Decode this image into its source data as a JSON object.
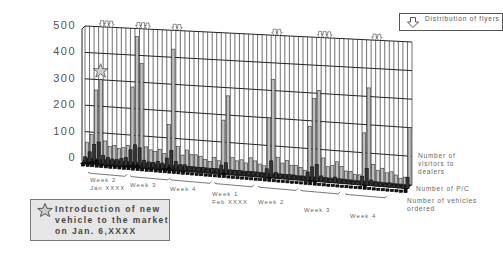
{
  "chart_data": {
    "type": "bar",
    "title": "",
    "xlabel": "",
    "ylabel": "",
    "ylim": [
      0,
      500
    ],
    "y_ticks": [
      "500",
      "400",
      "300",
      "200",
      "100",
      "0"
    ],
    "grid": true,
    "style": "3d-bar",
    "legend_position": "right",
    "week_labels": [
      {
        "line1": "Week 2",
        "line2": "Jan XXXX"
      },
      {
        "line1": "Week 3",
        "line2": ""
      },
      {
        "line1": "Week 4",
        "line2": ""
      },
      {
        "line1": "Week 1",
        "line2": "Feb XXXX"
      },
      {
        "line1": "Week 2",
        "line2": ""
      },
      {
        "line1": "Week 3",
        "line2": ""
      },
      {
        "line1": "Week 4",
        "line2": ""
      }
    ],
    "series": [
      {
        "name": "Number of visitors to dealers",
        "values": [
          60,
          90,
          260,
          300,
          70,
          50,
          55,
          45,
          50,
          60,
          280,
          470,
          370,
          60,
          50,
          45,
          55,
          40,
          150,
          430,
          70,
          40,
          60,
          45,
          45,
          40,
          30,
          25,
          40,
          30,
          180,
          270,
          45,
          35,
          40,
          30,
          50,
          40,
          30,
          25,
          200,
          340,
          60,
          40,
          50,
          35,
          35,
          30,
          20,
          180,
          280,
          310,
          70,
          40,
          45,
          60,
          45,
          30,
          30,
          20,
          20,
          170,
          330,
          60,
          40,
          50,
          35,
          40,
          30,
          20,
          25,
          200
        ]
      },
      {
        "name": "Number of P/C",
        "values": [
          20,
          40,
          70,
          80,
          30,
          25,
          20,
          20,
          25,
          30,
          60,
          80,
          70,
          25,
          20,
          20,
          25,
          20,
          40,
          70,
          30,
          20,
          20,
          15,
          15,
          15,
          15,
          10,
          15,
          15,
          30,
          40,
          15,
          15,
          15,
          10,
          15,
          15,
          15,
          10,
          30,
          60,
          20,
          15,
          15,
          15,
          15,
          10,
          10,
          30,
          50,
          60,
          20,
          15,
          15,
          20,
          15,
          15,
          10,
          10,
          10,
          30,
          60,
          20,
          15,
          15,
          10,
          15,
          10,
          10,
          10,
          40
        ]
      },
      {
        "name": "Number of vehicles ordered",
        "values": [
          10,
          15,
          20,
          25,
          10,
          10,
          10,
          10,
          10,
          10,
          15,
          20,
          20,
          10,
          10,
          10,
          10,
          10,
          15,
          20,
          10,
          10,
          10,
          8,
          8,
          8,
          8,
          8,
          8,
          8,
          10,
          15,
          8,
          8,
          8,
          8,
          8,
          8,
          8,
          8,
          10,
          15,
          8,
          8,
          8,
          8,
          8,
          8,
          8,
          10,
          15,
          15,
          8,
          8,
          8,
          8,
          8,
          8,
          8,
          8,
          8,
          10,
          15,
          8,
          8,
          8,
          8,
          8,
          8,
          8,
          8,
          15
        ]
      }
    ],
    "annotations": [
      {
        "type": "star",
        "label": "Introduction of new vehicle to the market on Jan. 6,XXXX"
      },
      {
        "type": "flyer-arrows",
        "label": "Distribution of flyers",
        "count": 6
      }
    ]
  },
  "legend": {
    "flyer_label": "Distribution of flyers"
  },
  "note": {
    "text": "Introduction of new vehicle to the market on Jan. 6,XXXX"
  },
  "series_labels": {
    "visitors": "Number of visitors to dealers",
    "pc": "Number of P/C",
    "orders": "Number of vehicles ordered"
  }
}
